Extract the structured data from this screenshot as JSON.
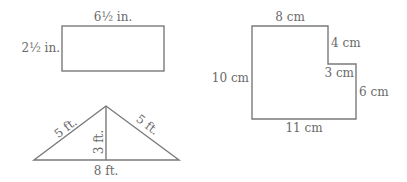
{
  "figures": {
    "rectangle": {
      "width_label": "6½ in.",
      "height_label": "2½ in."
    },
    "triangle": {
      "left_side_label": "5 ft.",
      "right_side_label": "5 ft.",
      "height_label": "3 ft.",
      "base_label": "8 ft."
    },
    "l_shape": {
      "top_label": "8 cm",
      "upper_right_label": "4 cm",
      "step_label": "3 cm",
      "lower_right_label": "6 cm",
      "left_label": "10 cm",
      "bottom_label": "11 cm"
    }
  },
  "colors": {
    "stroke": "#7a7a7a",
    "text": "#6a6a6a"
  }
}
